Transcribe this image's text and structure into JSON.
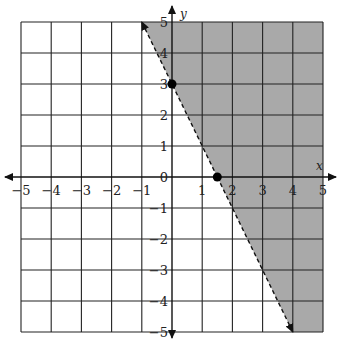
{
  "chart_data": {
    "type": "line",
    "title": "",
    "xlabel": "x",
    "ylabel": "y",
    "xlim": [
      -5,
      5
    ],
    "ylim": [
      -5,
      5
    ],
    "grid": true,
    "x_ticks": [
      -5,
      -4,
      -3,
      -2,
      -1,
      1,
      2,
      3,
      4,
      5
    ],
    "y_ticks": [
      -5,
      -4,
      -3,
      -2,
      -1,
      0,
      1,
      2,
      3,
      4,
      5
    ],
    "x_tick_labels": [
      "-5",
      "-4",
      "-3",
      "-2",
      "-1",
      "1",
      "2",
      "3",
      "4",
      "5"
    ],
    "y_tick_labels": [
      "-5",
      "-4",
      "-3",
      "-2",
      "-1",
      "0",
      "1",
      "2",
      "3",
      "4",
      "5"
    ],
    "inequality": "y > -2x + 3",
    "boundary_line": {
      "equation": "y = -2x + 3",
      "slope": -2,
      "intercept": 3,
      "style": "dashed",
      "endpoints": [
        [
          -1,
          5
        ],
        [
          4,
          -5
        ]
      ],
      "arrows": "both"
    },
    "points": [
      {
        "x": 0,
        "y": 3,
        "label": "y-intercept"
      },
      {
        "x": 1.5,
        "y": 0,
        "label": "x-intercept"
      }
    ],
    "shaded_region": {
      "side": "right/above line",
      "polygon": [
        [
          -1,
          5
        ],
        [
          5,
          5
        ],
        [
          5,
          -5
        ],
        [
          4,
          -5
        ]
      ],
      "color": "#a9a9a9"
    },
    "colors": {
      "grid": "#222222",
      "shade": "#a9a9a9",
      "line": "#111111",
      "point": "#000000"
    }
  },
  "labels": {
    "x_axis": "x",
    "y_axis": "y",
    "origin": "0"
  }
}
